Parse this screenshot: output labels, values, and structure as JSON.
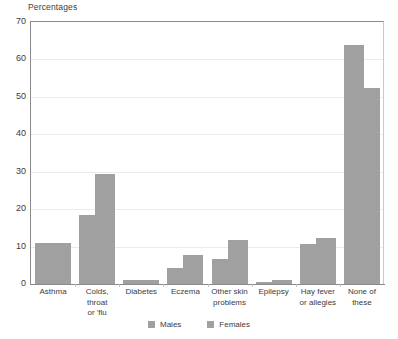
{
  "chart_data": {
    "type": "bar",
    "title": "Percentages",
    "xlabel": "",
    "ylabel": "",
    "ylim": [
      0,
      70
    ],
    "yticks": [
      0,
      10,
      20,
      30,
      40,
      50,
      60,
      70
    ],
    "grid": true,
    "legend_position": "bottom-center",
    "bar_color": "#a0a0a0",
    "categories": [
      "Asthma",
      "Colds, throat\nor 'flu",
      "Diabetes",
      "Eczema",
      "Other skin\nproblems",
      "Epilepsy",
      "Hay fever\nor allegies",
      "None of these"
    ],
    "series": [
      {
        "name": "Males",
        "color": "#a0a0a0",
        "values": [
          11.0,
          18.4,
          1.2,
          4.3,
          6.8,
          0.5,
          10.7,
          64.0
        ]
      },
      {
        "name": "Females",
        "color": "#a0a0a0",
        "values": [
          11.0,
          29.5,
          1.2,
          7.7,
          11.8,
          1.0,
          12.2,
          52.5
        ]
      }
    ]
  }
}
